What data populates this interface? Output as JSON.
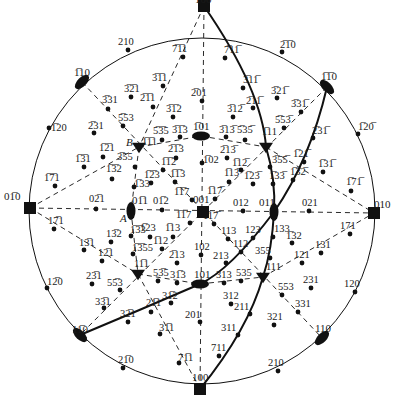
{
  "colors": {
    "ink": "#111111",
    "background": "#ffffff"
  },
  "primitive_circle": {
    "cx": 202,
    "cy": 211,
    "r": 173
  },
  "special_points": {
    "A": {
      "label": "A",
      "x": 120,
      "y": 210
    },
    "B": {
      "label": "B",
      "x": 130,
      "y": 120
    }
  },
  "poles_square": [
    {
      "label": "1̅00",
      "x": 204,
      "y": 6,
      "lx": 195,
      "ly": 3
    },
    {
      "label": "100",
      "x": 200,
      "y": 389,
      "lx": 192,
      "ly": 381
    },
    {
      "label": "01̅0",
      "x": 30,
      "y": 208,
      "lx": 4,
      "ly": 200
    },
    {
      "label": "010",
      "x": 374,
      "y": 213,
      "lx": 374,
      "ly": 208
    },
    {
      "label": "001",
      "x": 203,
      "y": 212,
      "lx": 193,
      "ly": 203
    }
  ],
  "poles_ellipse": [
    {
      "label": "1̅10",
      "x": 82,
      "y": 82,
      "rot": -45,
      "lx": 74,
      "ly": 76
    },
    {
      "label": "1̅1̅0",
      "x": 327,
      "y": 87,
      "rot": 45,
      "lx": 321,
      "ly": 80
    },
    {
      "label": "11̅0",
      "x": 80,
      "y": 335,
      "rot": 45,
      "lx": 72,
      "ly": 333
    },
    {
      "label": "110",
      "x": 322,
      "y": 338,
      "rot": -45,
      "lx": 315,
      "ly": 332
    },
    {
      "label": "1̅01",
      "x": 201,
      "y": 136,
      "rot": 0,
      "lx": 193,
      "ly": 130
    },
    {
      "label": "101",
      "x": 200,
      "y": 284,
      "rot": 0,
      "lx": 194,
      "ly": 278
    },
    {
      "label": "01̅1",
      "x": 131,
      "y": 211,
      "rot": 90,
      "lx": 132,
      "ly": 204
    },
    {
      "label": "011",
      "x": 274,
      "y": 212,
      "rot": 90,
      "lx": 259,
      "ly": 206
    }
  ],
  "poles_triangle": [
    {
      "label": "1̅1̅1",
      "x": 139,
      "y": 147,
      "lx": 142,
      "ly": 145
    },
    {
      "label": "1̅11",
      "x": 266,
      "y": 147,
      "lx": 262,
      "ly": 135
    },
    {
      "label": "11̅1",
      "x": 138,
      "y": 274,
      "lx": 134,
      "ly": 267
    },
    {
      "label": "111",
      "x": 263,
      "y": 277,
      "lx": 266,
      "ly": 270
    }
  ],
  "poles_dot": [
    {
      "label": "210",
      "x": 128,
      "y": 50,
      "lx": 118,
      "ly": 45
    },
    {
      "label": "7̅1̅1",
      "x": 183,
      "y": 57,
      "lx": 172,
      "ly": 52
    },
    {
      "label": "3̅1̅1",
      "x": 163,
      "y": 86,
      "lx": 152,
      "ly": 81
    },
    {
      "label": "3̅2̅1",
      "x": 131,
      "y": 97,
      "lx": 124,
      "ly": 92
    },
    {
      "label": "2̅1̅1",
      "x": 153,
      "y": 107,
      "lx": 140,
      "ly": 101
    },
    {
      "label": "3̅31",
      "x": 108,
      "y": 109,
      "lx": 102,
      "ly": 103
    },
    {
      "label": "5̅53",
      "x": 123,
      "y": 126,
      "lx": 118,
      "ly": 121
    },
    {
      "label": "1̅20",
      "x": 49,
      "y": 128,
      "lx": 51,
      "ly": 131
    },
    {
      "label": "2̅31",
      "x": 94,
      "y": 133,
      "lx": 88,
      "ly": 129
    },
    {
      "label": "2̅01",
      "x": 202,
      "y": 101,
      "lx": 191,
      "ly": 96
    },
    {
      "label": "3̅1̅2",
      "x": 173,
      "y": 117,
      "lx": 166,
      "ly": 112
    },
    {
      "label": "5̅3̅5",
      "x": 162,
      "y": 140,
      "lx": 153,
      "ly": 134
    },
    {
      "label": "3̅1̅3",
      "x": 180,
      "y": 137,
      "lx": 172,
      "ly": 133
    },
    {
      "label": "2̅1̅3",
      "x": 176,
      "y": 158,
      "lx": 168,
      "ly": 152
    },
    {
      "label": "1̅1̅2",
      "x": 163,
      "y": 170,
      "lx": 161,
      "ly": 165
    },
    {
      "label": "1̅1̅3",
      "x": 175,
      "y": 182,
      "lx": 170,
      "ly": 177
    },
    {
      "label": "1̅1̅7",
      "x": 192,
      "y": 200,
      "lx": 174,
      "ly": 195
    },
    {
      "label": "1̅2̅3",
      "x": 151,
      "y": 183,
      "lx": 144,
      "ly": 178
    },
    {
      "label": "1̅33",
      "x": 134,
      "y": 187,
      "lx": 134,
      "ly": 187
    },
    {
      "label": "1̅3̅2",
      "x": 112,
      "y": 179,
      "lx": 106,
      "ly": 172
    },
    {
      "label": "3̅55",
      "x": 135,
      "y": 167,
      "lx": 117,
      "ly": 160
    },
    {
      "label": "1̅2̅1",
      "x": 103,
      "y": 157,
      "lx": 99,
      "ly": 151
    },
    {
      "label": "1̅3̅1",
      "x": 84,
      "y": 167,
      "lx": 75,
      "ly": 162
    },
    {
      "label": "1̅7̅1",
      "x": 55,
      "y": 186,
      "lx": 44,
      "ly": 181
    },
    {
      "label": "02̅1",
      "x": 96,
      "y": 209,
      "lx": 89,
      "ly": 202
    },
    {
      "label": "01̅2",
      "x": 162,
      "y": 210,
      "lx": 153,
      "ly": 204
    },
    {
      "label": "1̅17",
      "x": 190,
      "y": 223,
      "lx": 176,
      "ly": 218
    },
    {
      "label": "1̅13",
      "x": 173,
      "y": 237,
      "lx": 165,
      "ly": 231
    },
    {
      "label": "1̅12",
      "x": 162,
      "y": 249,
      "lx": 153,
      "ly": 244
    },
    {
      "label": "1̅23",
      "x": 150,
      "y": 237,
      "lx": 140,
      "ly": 231
    },
    {
      "label": "1̅3̅3",
      "x": 131,
      "y": 236,
      "lx": 130,
      "ly": 233
    },
    {
      "label": "1̅3̅55",
      "x": 133,
      "y": 254,
      "lx": 132,
      "ly": 251
    },
    {
      "label": "2̅13",
      "x": 177,
      "y": 263,
      "lx": 169,
      "ly": 258
    },
    {
      "label": "13̅2",
      "x": 111,
      "y": 242,
      "lx": 106,
      "ly": 237
    },
    {
      "label": "17̅1",
      "x": 54,
      "y": 229,
      "lx": 48,
      "ly": 224
    },
    {
      "label": "13̅1",
      "x": 84,
      "y": 250,
      "lx": 79,
      "ly": 246
    },
    {
      "label": "12̅1",
      "x": 102,
      "y": 261,
      "lx": 98,
      "ly": 256
    },
    {
      "label": "12̅0",
      "x": 47,
      "y": 288,
      "lx": 47,
      "ly": 285
    },
    {
      "label": "23̅1",
      "x": 92,
      "y": 284,
      "lx": 86,
      "ly": 279
    },
    {
      "label": "55̅3",
      "x": 120,
      "y": 290,
      "lx": 107,
      "ly": 286
    },
    {
      "label": "33̅1",
      "x": 104,
      "y": 308,
      "lx": 95,
      "ly": 305
    },
    {
      "label": "53̅5",
      "x": 158,
      "y": 281,
      "lx": 153,
      "ly": 276
    },
    {
      "label": "31̅3",
      "x": 177,
      "y": 283,
      "lx": 170,
      "ly": 278
    },
    {
      "label": "31̅2",
      "x": 171,
      "y": 303,
      "lx": 162,
      "ly": 299
    },
    {
      "label": "21̅1",
      "x": 151,
      "y": 312,
      "lx": 146,
      "ly": 306
    },
    {
      "label": "32̅1",
      "x": 128,
      "y": 322,
      "lx": 120,
      "ly": 317
    },
    {
      "label": "31̅1",
      "x": 160,
      "y": 334,
      "lx": 159,
      "ly": 331
    },
    {
      "label": "71̅1",
      "x": 179,
      "y": 363,
      "lx": 178,
      "ly": 361
    },
    {
      "label": "21̅0",
      "x": 123,
      "y": 368,
      "lx": 118,
      "ly": 363
    },
    {
      "label": "201",
      "x": 200,
      "y": 322,
      "lx": 185,
      "ly": 318
    },
    {
      "label": "711",
      "x": 219,
      "y": 356,
      "lx": 211,
      "ly": 351
    },
    {
      "label": "311",
      "x": 238,
      "y": 335,
      "lx": 221,
      "ly": 331
    },
    {
      "label": "211",
      "x": 250,
      "y": 314,
      "lx": 234,
      "ly": 310
    },
    {
      "label": "312",
      "x": 231,
      "y": 304,
      "lx": 223,
      "ly": 299
    },
    {
      "label": "321",
      "x": 274,
      "y": 325,
      "lx": 267,
      "ly": 320
    },
    {
      "label": "313",
      "x": 224,
      "y": 283,
      "lx": 216,
      "ly": 278
    },
    {
      "label": "535",
      "x": 241,
      "y": 281,
      "lx": 236,
      "ly": 276
    },
    {
      "label": "553",
      "x": 282,
      "y": 295,
      "lx": 278,
      "ly": 290
    },
    {
      "label": "331",
      "x": 298,
      "y": 312,
      "lx": 295,
      "ly": 307
    },
    {
      "label": "231",
      "x": 311,
      "y": 288,
      "lx": 303,
      "ly": 283
    },
    {
      "label": "120",
      "x": 355,
      "y": 292,
      "lx": 344,
      "ly": 287
    },
    {
      "label": "210",
      "x": 278,
      "y": 371,
      "lx": 268,
      "ly": 366
    },
    {
      "label": "102",
      "x": 201,
      "y": 255,
      "lx": 194,
      "ly": 250
    },
    {
      "label": "213",
      "x": 226,
      "y": 263,
      "lx": 213,
      "ly": 259
    },
    {
      "label": "112",
      "x": 241,
      "y": 252,
      "lx": 233,
      "ly": 247
    },
    {
      "label": "113",
      "x": 228,
      "y": 239,
      "lx": 221,
      "ly": 234
    },
    {
      "label": "123",
      "x": 253,
      "y": 238,
      "lx": 245,
      "ly": 233
    },
    {
      "label": "133",
      "x": 273,
      "y": 237,
      "lx": 274,
      "ly": 232
    },
    {
      "label": "355",
      "x": 270,
      "y": 258,
      "lx": 255,
      "ly": 254
    },
    {
      "label": "1̅17̅",
      "x": 214,
      "y": 224,
      "lx": 203,
      "ly": 219
    },
    {
      "label": "012",
      "x": 243,
      "y": 211,
      "lx": 233,
      "ly": 206
    },
    {
      "label": "021",
      "x": 309,
      "y": 211,
      "lx": 302,
      "ly": 206
    },
    {
      "label": "1̅32",
      "x": 292,
      "y": 243,
      "lx": 286,
      "ly": 239
    },
    {
      "label": "121",
      "x": 302,
      "y": 263,
      "lx": 294,
      "ly": 258
    },
    {
      "label": "131",
      "x": 321,
      "y": 253,
      "lx": 315,
      "ly": 248
    },
    {
      "label": "171",
      "x": 350,
      "y": 234,
      "lx": 340,
      "ly": 229
    },
    {
      "label": "1̅17̅b",
      "x": 215,
      "y": 199,
      "lx": 207,
      "ly": 194
    },
    {
      "label": "1̅13̅",
      "x": 229,
      "y": 182,
      "lx": 224,
      "ly": 176
    },
    {
      "label": "1̅23̅",
      "x": 253,
      "y": 184,
      "lx": 244,
      "ly": 179
    },
    {
      "label": "1̅33̅",
      "x": 273,
      "y": 184,
      "lx": 269,
      "ly": 179
    },
    {
      "label": "1̅32̅",
      "x": 293,
      "y": 180,
      "lx": 290,
      "ly": 175
    },
    {
      "label": "1̅02",
      "x": 202,
      "y": 163,
      "lx": 203,
      "ly": 163
    },
    {
      "label": "1̅12̅",
      "x": 241,
      "y": 170,
      "lx": 232,
      "ly": 166
    },
    {
      "label": "2̅13̅",
      "x": 227,
      "y": 158,
      "lx": 220,
      "ly": 153
    },
    {
      "label": "3̅13̅",
      "x": 226,
      "y": 137,
      "lx": 219,
      "ly": 133
    },
    {
      "label": "5̅35̅",
      "x": 245,
      "y": 140,
      "lx": 237,
      "ly": 133
    },
    {
      "label": "3̅12̅",
      "x": 233,
      "y": 117,
      "lx": 227,
      "ly": 112
    },
    {
      "label": "2̅11̅",
      "x": 253,
      "y": 108,
      "lx": 246,
      "ly": 104
    },
    {
      "label": "3̅11̅",
      "x": 243,
      "y": 88,
      "lx": 243,
      "ly": 83
    },
    {
      "label": "7̅11̅",
      "x": 225,
      "y": 58,
      "lx": 224,
      "ly": 53
    },
    {
      "label": "2̅1̅0",
      "x": 282,
      "y": 52,
      "lx": 280,
      "ly": 48
    },
    {
      "label": "3̅21̅",
      "x": 277,
      "y": 98,
      "lx": 271,
      "ly": 94
    },
    {
      "label": "3̅31̅",
      "x": 301,
      "y": 112,
      "lx": 291,
      "ly": 107
    },
    {
      "label": "5̅53̅",
      "x": 284,
      "y": 128,
      "lx": 275,
      "ly": 123
    },
    {
      "label": "1̅20̅",
      "x": 358,
      "y": 134,
      "lx": 358,
      "ly": 130
    },
    {
      "label": "2̅31̅",
      "x": 313,
      "y": 138,
      "lx": 312,
      "ly": 134
    },
    {
      "label": "3̅55̅",
      "x": 270,
      "y": 167,
      "lx": 272,
      "ly": 163
    },
    {
      "label": "1̅21̅",
      "x": 304,
      "y": 162,
      "lx": 293,
      "ly": 157
    },
    {
      "label": "1̅31̅",
      "x": 323,
      "y": 172,
      "lx": 318,
      "ly": 167
    },
    {
      "label": "1̅71̅",
      "x": 351,
      "y": 191,
      "lx": 346,
      "ly": 185
    }
  ],
  "dashed_lines": [
    {
      "name": "meridian-vertical",
      "x1": 204,
      "y1": 6,
      "x2": 200,
      "y2": 389
    },
    {
      "name": "equator-horizontal",
      "x1": 30,
      "y1": 208,
      "x2": 374,
      "y2": 213
    },
    {
      "name": "diagonal-110-bar-to-110",
      "x1": 82,
      "y1": 82,
      "x2": 322,
      "y2": 338
    },
    {
      "name": "diagonal-1bar1bar0-to-1bar10",
      "x1": 327,
      "y1": 87,
      "x2": 80,
      "y2": 335
    },
    {
      "name": "line-010bar-to-1bar1bar1",
      "x1": 30,
      "y1": 208,
      "x2": 139,
      "y2": 147
    },
    {
      "name": "line-1bar1bar1-to-1bar01",
      "x1": 139,
      "y1": 147,
      "x2": 201,
      "y2": 136
    },
    {
      "name": "line-1bar01-to-1bar11",
      "x1": 201,
      "y1": 136,
      "x2": 266,
      "y2": 147
    },
    {
      "name": "line-1bar11-to-010",
      "x1": 266,
      "y1": 147,
      "x2": 374,
      "y2": 213
    },
    {
      "name": "line-010bar-to-11bar1",
      "x1": 30,
      "y1": 208,
      "x2": 138,
      "y2": 274
    },
    {
      "name": "line-11bar1-to-101",
      "x1": 138,
      "y1": 274,
      "x2": 200,
      "y2": 284
    },
    {
      "name": "line-101-to-111",
      "x1": 200,
      "y1": 284,
      "x2": 263,
      "y2": 277
    },
    {
      "name": "line-111-to-010",
      "x1": 263,
      "y1": 277,
      "x2": 374,
      "y2": 213
    },
    {
      "name": "line-1bar00-to-1bar1bar1",
      "x1": 204,
      "y1": 6,
      "x2": 139,
      "y2": 147
    },
    {
      "name": "line-1bar1bar1-to-01bar1",
      "x1": 139,
      "y1": 147,
      "x2": 131,
      "y2": 211
    },
    {
      "name": "line-01bar1-to-11bar1",
      "x1": 131,
      "y1": 211,
      "x2": 138,
      "y2": 274
    },
    {
      "name": "line-11bar1-to-100",
      "x1": 138,
      "y1": 274,
      "x2": 200,
      "y2": 389
    }
  ],
  "solid_curves": [
    {
      "name": "great-circle-1bar00-011-100",
      "d": "M204,6 Q262,90 266,147 Q276,180 274,212 Q272,250 263,277 Q248,330 200,389"
    },
    {
      "name": "great-circle-1bar1bar0-011-11bar0",
      "d": "M327,87 Q310,160 274,212 Q230,270 200,284 Q140,310 80,335"
    }
  ]
}
